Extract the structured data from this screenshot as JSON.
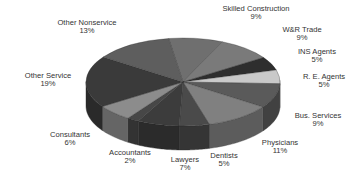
{
  "chart_data": {
    "type": "pie",
    "style": "3d-tilted",
    "title": "",
    "legend": "none",
    "slices": [
      {
        "label": "Skilled Construction",
        "value": 9,
        "pct_label": "9%",
        "color": "#6f6f6f"
      },
      {
        "label": "W&R Trade",
        "value": 9,
        "pct_label": "9%",
        "color": "#7a7a7a"
      },
      {
        "label": "INS Agents",
        "value": 5,
        "pct_label": "5%",
        "color": "#2e2e2e"
      },
      {
        "label": "R. E. Agents",
        "value": 5,
        "pct_label": "5%",
        "color": "#c9c9c9"
      },
      {
        "label": "Bus. Services",
        "value": 9,
        "pct_label": "9%",
        "color": "#5a5a5a"
      },
      {
        "label": "Physicians",
        "value": 11,
        "pct_label": "11%",
        "color": "#808080"
      },
      {
        "label": "Dentists",
        "value": 5,
        "pct_label": "5%",
        "color": "#4a4a4a"
      },
      {
        "label": "Lawyers",
        "value": 7,
        "pct_label": "7%",
        "color": "#3c3c3c"
      },
      {
        "label": "Accountants",
        "value": 2,
        "pct_label": "2%",
        "color": "#474747"
      },
      {
        "label": "Consultants",
        "value": 6,
        "pct_label": "6%",
        "color": "#8c8c8c"
      },
      {
        "label": "Other Service",
        "value": 19,
        "pct_label": "19%",
        "color": "#3a3a3a"
      },
      {
        "label": "Other Nonservice",
        "value": 13,
        "pct_label": "13%",
        "color": "#5e5e5e"
      }
    ]
  },
  "labels": [
    {
      "name": "Skilled Construction",
      "pct": "9%",
      "x": 256,
      "y": 13
    },
    {
      "name": "W&R Trade",
      "pct": "9%",
      "x": 302,
      "y": 34
    },
    {
      "name": "INS Agents",
      "pct": "5%",
      "x": 317,
      "y": 56
    },
    {
      "name": "R. E. Agents",
      "pct": "5%",
      "x": 324,
      "y": 81
    },
    {
      "name": "Bus. Services",
      "pct": "9%",
      "x": 318,
      "y": 120
    },
    {
      "name": "Physicians",
      "pct": "11%",
      "x": 280,
      "y": 147
    },
    {
      "name": "Dentists",
      "pct": "5%",
      "x": 224,
      "y": 160
    },
    {
      "name": "Lawyers",
      "pct": "7%",
      "x": 185,
      "y": 164
    },
    {
      "name": "Accountants",
      "pct": "2%",
      "x": 130,
      "y": 157
    },
    {
      "name": "Consultants",
      "pct": "6%",
      "x": 70,
      "y": 139
    },
    {
      "name": "Other Service",
      "pct": "19%",
      "x": 48,
      "y": 80
    },
    {
      "name": "Other Nonservice",
      "pct": "13%",
      "x": 87,
      "y": 27
    }
  ]
}
